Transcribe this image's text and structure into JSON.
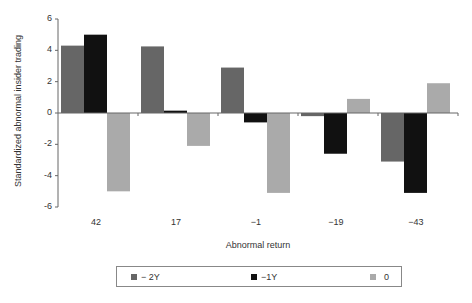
{
  "chart_data": {
    "type": "bar",
    "title": "",
    "xlabel": "Abnormal return",
    "ylabel": "Standardized abnormal insider trading",
    "categories": [
      "42",
      "17",
      "−1",
      "−19",
      "−43"
    ],
    "series": [
      {
        "name": "− 2Y",
        "color": "#666666",
        "values": [
          4.3,
          4.25,
          2.9,
          -0.2,
          -3.1
        ]
      },
      {
        "name": "−1Y",
        "color": "#111111",
        "values": [
          5.0,
          0.15,
          -0.6,
          -2.6,
          -5.1
        ]
      },
      {
        "name": "0",
        "color": "#aaaaaa",
        "values": [
          -5.0,
          -2.1,
          -5.1,
          0.9,
          1.9
        ]
      }
    ],
    "ylim": [
      -6,
      6
    ],
    "yticks": [
      "6",
      "4",
      "2",
      "0",
      "-2",
      "-4",
      "-6"
    ],
    "grid": false,
    "legend_position": "bottom"
  }
}
